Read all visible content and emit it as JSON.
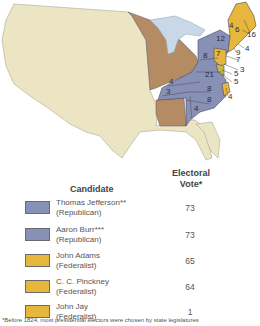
{
  "map": {
    "colors": {
      "republican": "#8891b5",
      "federalist": "#e6b73c",
      "territory": "#b48b62",
      "unorganized": "#ece5c4",
      "water": "#c8d8e6",
      "border": "#5a5a6a"
    },
    "state_labels": [
      {
        "state": "Vermont",
        "value": "4"
      },
      {
        "state": "New Hampshire",
        "value": "6"
      },
      {
        "state": "Massachusetts",
        "value": "16"
      },
      {
        "state": "Rhode Island",
        "value": "4"
      },
      {
        "state": "Connecticut",
        "value": "9"
      },
      {
        "state": "New York",
        "value": "12"
      },
      {
        "state": "New Jersey",
        "value": "7"
      },
      {
        "state": "Pennsylvania",
        "value": "8"
      },
      {
        "state": "Delaware",
        "value": "3"
      },
      {
        "state": "Maryland (Federalist)",
        "value": "5"
      },
      {
        "state": "Maryland (Republican)",
        "value": "5"
      },
      {
        "state": "Virginia",
        "value": "21"
      },
      {
        "state": "Kentucky",
        "value": "4"
      },
      {
        "state": "Tennessee",
        "value": "3"
      },
      {
        "state": "North Carolina (Republican)",
        "value": "8"
      },
      {
        "state": "North Carolina (Federalist)",
        "value": "4"
      },
      {
        "state": "South Carolina",
        "value": "8"
      },
      {
        "state": "Georgia",
        "value": "4"
      },
      {
        "state": "New Jersey leader",
        "value": "7"
      }
    ]
  },
  "legend": {
    "header_candidate": "Candidate",
    "header_vote_line1": "Electoral",
    "header_vote_line2": "Vote*",
    "rows": [
      {
        "name": "Thomas Jefferson**",
        "party": "(Republican)",
        "votes": "73",
        "color": "#8891b5"
      },
      {
        "name": "Aaron Burr***",
        "party": "(Republican)",
        "votes": "73",
        "color": "#8891b5"
      },
      {
        "name": "John Adams",
        "party": "(Federalist)",
        "votes": "65",
        "color": "#e6b73c"
      },
      {
        "name": "C. C. Pinckney",
        "party": "(Federalist)",
        "votes": "64",
        "color": "#e6b73c"
      },
      {
        "name": "John Jay",
        "party": "(Federalist)",
        "votes": "1",
        "color": "#e6b73c"
      }
    ]
  },
  "footnote": "*Before 1824, most presidential electors were chosen by state legislatures"
}
